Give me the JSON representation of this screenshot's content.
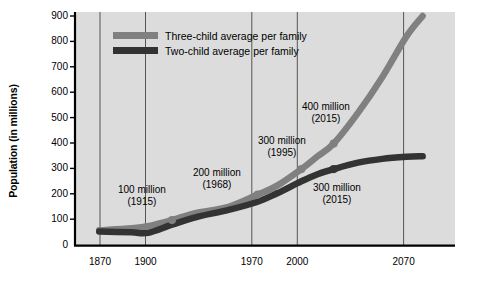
{
  "chart_data": {
    "type": "line",
    "title": "",
    "xlabel": "",
    "ylabel": "Population (in millions)",
    "xlim": [
      1855,
      2090
    ],
    "ylim": [
      0,
      900
    ],
    "grid": "vertical gridlines at labeled x ticks only",
    "legend_position": "top-left inside plot",
    "xticks": [
      1870,
      1900,
      1970,
      2000,
      2070
    ],
    "xtick_labels": [
      "1870",
      "1900",
      "1970",
      "2000",
      "2070"
    ],
    "yticks": [
      0,
      100,
      200,
      300,
      400,
      500,
      600,
      700,
      800,
      900
    ],
    "ytick_labels": [
      "0",
      "100",
      "200",
      "300",
      "400",
      "500",
      "600",
      "700",
      "800",
      "900"
    ],
    "series": [
      {
        "name": "Three-child average per family",
        "color": "#808080",
        "x": [
          1870,
          1890,
          1900,
          1915,
          1930,
          1950,
          1968,
          1980,
          1995,
          2005,
          2015,
          2030,
          2045,
          2060,
          2070
        ],
        "values": [
          60,
          68,
          76,
          100,
          128,
          152,
          200,
          235,
          300,
          350,
          400,
          520,
          660,
          820,
          900
        ]
      },
      {
        "name": "Two-child average per family",
        "color": "#333333",
        "x": [
          1870,
          1890,
          1900,
          1915,
          1930,
          1950,
          1968,
          1980,
          1995,
          2005,
          2015,
          2030,
          2045,
          2060,
          2070
        ],
        "values": [
          55,
          52,
          50,
          82,
          112,
          140,
          172,
          205,
          252,
          280,
          300,
          325,
          340,
          348,
          350
        ]
      }
    ],
    "markers": [
      {
        "series": "Three-child average per family",
        "x": 1915,
        "y": 100
      },
      {
        "series": "Three-child average per family",
        "x": 1968,
        "y": 200
      },
      {
        "series": "Three-child average per family",
        "x": 1995,
        "y": 300
      },
      {
        "series": "Three-child average per family",
        "x": 2015,
        "y": 400
      },
      {
        "series": "Two-child average per family",
        "x": 2015,
        "y": 300
      }
    ],
    "annotations": [
      {
        "value_label": "100 million",
        "year_label": "(1915)",
        "x": 1915,
        "y": 100
      },
      {
        "value_label": "200 million",
        "year_label": "(1968)",
        "x": 1968,
        "y": 200
      },
      {
        "value_label": "300 million",
        "year_label": "(1995)",
        "x": 1995,
        "y": 300
      },
      {
        "value_label": "400 million",
        "year_label": "(2015)",
        "x": 2015,
        "y": 400
      },
      {
        "value_label": "300 million",
        "year_label": "(2015)",
        "x": 2015,
        "y": 300
      }
    ]
  },
  "axes": {
    "y_title": "Population (in millions)",
    "y_ticks": [
      "900",
      "800",
      "700",
      "600",
      "500",
      "400",
      "300",
      "200",
      "100",
      "0"
    ],
    "x_ticks": [
      "1870",
      "1900",
      "1970",
      "2000",
      "2070"
    ]
  },
  "legend": {
    "items": [
      {
        "label": "Three-child average per family",
        "color": "#808080"
      },
      {
        "label": "Two-child average per family",
        "color": "#333333"
      }
    ]
  },
  "annotations": {
    "a1_value": "100 million",
    "a1_year": "(1915)",
    "a2_value": "200 million",
    "a2_year": "(1968)",
    "a3_value": "300 million",
    "a3_year": "(1995)",
    "a4_value": "400 million",
    "a4_year": "(2015)",
    "a5_value": "300 million",
    "a5_year": "(2015)"
  },
  "colors": {
    "plot_background": "#dcdcdc",
    "axis": "#000000",
    "gridline": "#555555",
    "three_child": "#808080",
    "two_child": "#333333"
  }
}
